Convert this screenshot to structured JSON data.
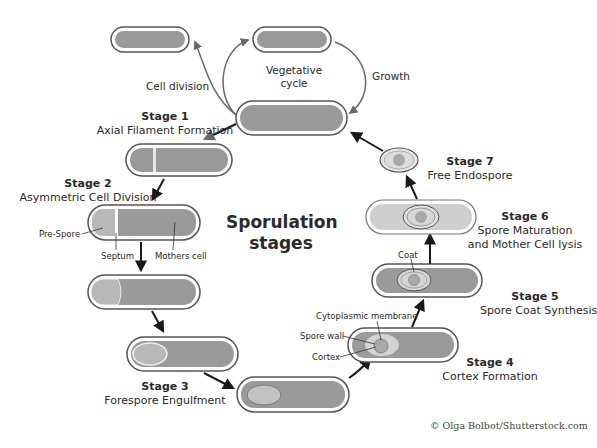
{
  "title": {
    "line1": "Sporulation",
    "line2": "stages"
  },
  "vegetative": {
    "cycle_line1": "Vegetative",
    "cycle_line2": "cycle",
    "cell_division": "Cell division",
    "growth": "Growth"
  },
  "stages": [
    {
      "number": "Stage 1",
      "name": "Axial Filament Formation"
    },
    {
      "number": "Stage 2",
      "name": "Asymmetric Cell Division"
    },
    {
      "number": "Stage 3",
      "name": "Forespore Engulfment"
    },
    {
      "number": "Stage 4",
      "name": "Cortex Formation"
    },
    {
      "number": "Stage 5",
      "name": "Spore Coat Synthesis"
    },
    {
      "number": "Stage 6",
      "name": "Spore Maturation",
      "name2": "and Mother Cell lysis"
    },
    {
      "number": "Stage 7",
      "name": "Free Endospore"
    }
  ],
  "annotations": {
    "pre_spore": "Pre-Spore",
    "septum": "Septum",
    "mothers_cell": "Mothers cell",
    "cytoplasmic_membrane": "Cytoplasmic membrane",
    "spore_wall": "Spore wall",
    "cortex": "Cortex",
    "coat": "Coat"
  },
  "credit": "© Olga Bolbot/Shutterstock.com",
  "colors": {
    "cell_fill": "#9a9a9a",
    "cell_outline": "#555555",
    "spore_fill": "#c2c2c2",
    "arrow": "#1a1a1a",
    "veg_arrow": "#6a6a6a"
  }
}
